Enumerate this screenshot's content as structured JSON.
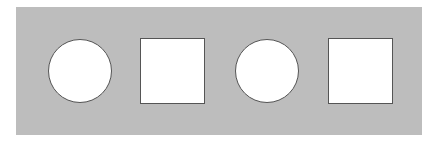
{
  "diagram": {
    "background_color": "#ffffff",
    "panel_color": "#bdbdbd",
    "shape_fill": "#ffffff",
    "shape_stroke": "#555555",
    "shapes": [
      {
        "type": "circle",
        "label": "circle"
      },
      {
        "type": "square",
        "label": "square"
      },
      {
        "type": "circle",
        "label": "circle"
      },
      {
        "type": "square",
        "label": "square"
      }
    ]
  }
}
